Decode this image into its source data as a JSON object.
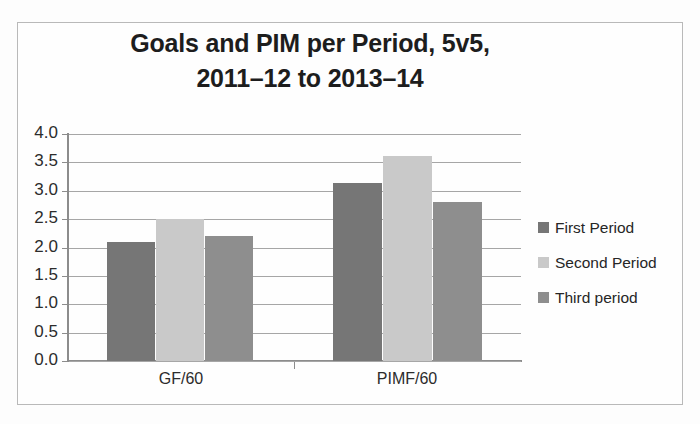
{
  "chart_data": {
    "type": "bar",
    "title": "Goals and PIM per Period, 5v5, 2011–12 to 2013–14",
    "title_lines": [
      "Goals and PIM per Period, 5v5,",
      "2011–12 to 2013–14"
    ],
    "categories": [
      "GF/60",
      "PIMF/60"
    ],
    "series": [
      {
        "name": "First Period",
        "values": [
          2.1,
          3.14
        ],
        "color": "#767676"
      },
      {
        "name": "Second Period",
        "values": [
          2.51,
          3.62
        ],
        "color": "#c9c9c9"
      },
      {
        "name": "Third period",
        "values": [
          2.2,
          2.81
        ],
        "color": "#8e8e8e"
      }
    ],
    "xlabel": "",
    "ylabel": "",
    "ylim": [
      0.0,
      4.0
    ],
    "ytick_step": 0.5,
    "ytick_labels": [
      "4.0",
      "3.5",
      "3.0",
      "2.5",
      "2.0",
      "1.5",
      "1.0",
      "0.5",
      "0.0"
    ],
    "ytick_values": [
      4.0,
      3.5,
      3.0,
      2.5,
      2.0,
      1.5,
      1.0,
      0.5,
      0.0
    ],
    "grid": true,
    "legend_position": "right",
    "legend_entries": [
      "First Period",
      "Second Period",
      "Third period"
    ]
  },
  "colors": {
    "series_first": "#767676",
    "series_second": "#c9c9c9",
    "series_third": "#8e8e8e",
    "gridline": "#a6a6a6",
    "axis": "#8c8c8c",
    "text": "#231f20",
    "frame": "#b9b9b9",
    "background": "#fdfdfd"
  }
}
